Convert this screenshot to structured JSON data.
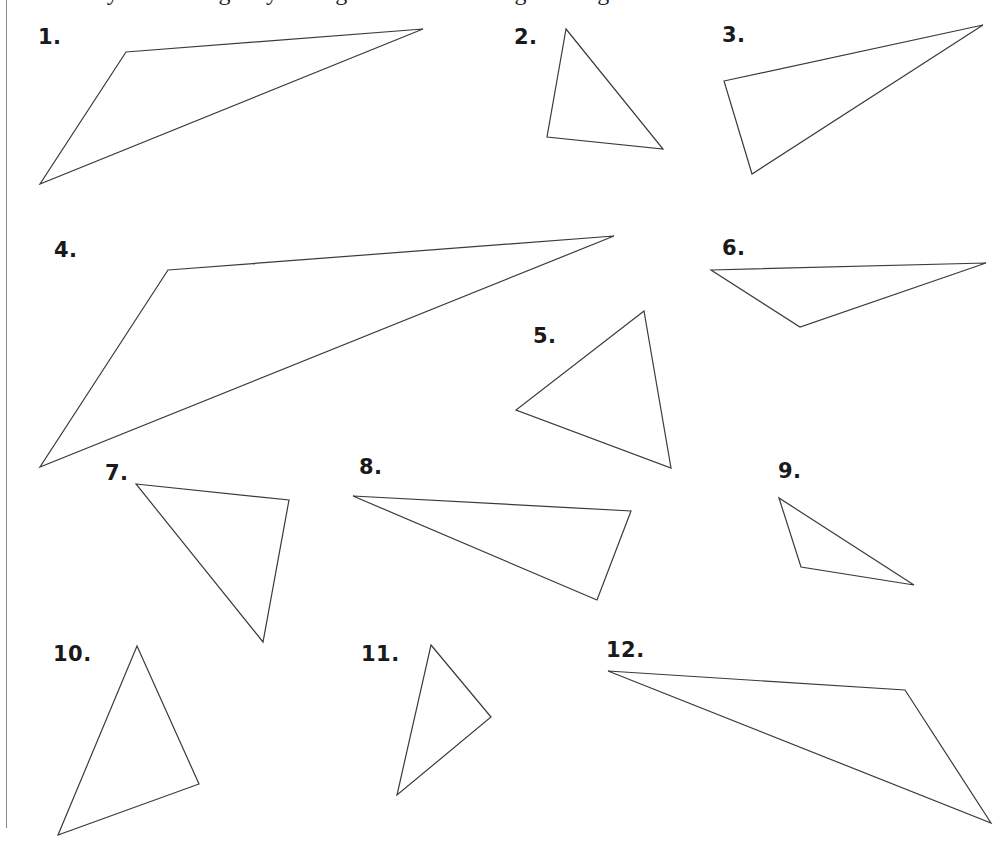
{
  "worksheet": {
    "instruction_clipped": "Classify each triangle by its angles and sides using the diagram.",
    "figures": [
      {
        "label": "1.",
        "label_pos": [
          38,
          27
        ],
        "points": [
          [
            126,
            52
          ],
          [
            423,
            29
          ],
          [
            40,
            184
          ]
        ]
      },
      {
        "label": "2.",
        "label_pos": [
          514,
          27
        ],
        "points": [
          [
            566,
            29
          ],
          [
            547,
            137
          ],
          [
            663,
            149
          ]
        ]
      },
      {
        "label": "3.",
        "label_pos": [
          722,
          25
        ],
        "points": [
          [
            724,
            81
          ],
          [
            983,
            25
          ],
          [
            752,
            174
          ]
        ]
      },
      {
        "label": "4.",
        "label_pos": [
          54,
          240
        ],
        "points": [
          [
            168,
            270
          ],
          [
            614,
            236
          ],
          [
            40,
            467
          ]
        ]
      },
      {
        "label": "5.",
        "label_pos": [
          533,
          326
        ],
        "points": [
          [
            644,
            311
          ],
          [
            516,
            410
          ],
          [
            671,
            468
          ]
        ]
      },
      {
        "label": "6.",
        "label_pos": [
          722,
          238
        ],
        "points": [
          [
            711,
            270
          ],
          [
            986,
            263
          ],
          [
            800,
            327
          ]
        ]
      },
      {
        "label": "7.",
        "label_pos": [
          105,
          463
        ],
        "points": [
          [
            136,
            484
          ],
          [
            289,
            500
          ],
          [
            263,
            642
          ]
        ]
      },
      {
        "label": "8.",
        "label_pos": [
          359,
          457
        ],
        "points": [
          [
            353,
            496
          ],
          [
            631,
            511
          ],
          [
            597,
            600
          ]
        ]
      },
      {
        "label": "9.",
        "label_pos": [
          778,
          461
        ],
        "points": [
          [
            779,
            498
          ],
          [
            801,
            567
          ],
          [
            914,
            585
          ]
        ]
      },
      {
        "label": "10.",
        "label_pos": [
          53,
          644
        ],
        "points": [
          [
            137,
            646
          ],
          [
            199,
            784
          ],
          [
            58,
            835
          ]
        ]
      },
      {
        "label": "11.",
        "label_pos": [
          361,
          644
        ],
        "points": [
          [
            431,
            645
          ],
          [
            491,
            717
          ],
          [
            397,
            795
          ]
        ]
      },
      {
        "label": "12.",
        "label_pos": [
          606,
          640
        ],
        "points": [
          [
            608,
            671
          ],
          [
            905,
            690
          ],
          [
            991,
            823
          ]
        ]
      }
    ],
    "colors": {
      "stroke": "#3a3a3a",
      "label": "#1a1a1a",
      "margin_line": "#8a8a8a"
    }
  }
}
